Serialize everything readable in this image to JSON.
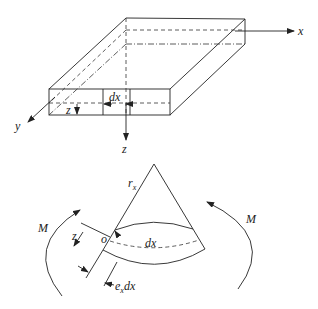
{
  "diagram": {
    "top_figure": {
      "description": "thin plate with coordinate axes and element dx",
      "axis_labels": {
        "x": "x",
        "y": "y",
        "z": "z"
      },
      "element_label": "dx",
      "offset_label": "z"
    },
    "bottom_figure": {
      "description": "bent plate element under moment M",
      "radius_label": "r",
      "radius_sub": "x",
      "moment_left": "M",
      "moment_right": "M",
      "element_label": "dx",
      "offset_label": "z",
      "origin_label": "o",
      "strain_label_prefix": "e",
      "strain_label_sub": "x",
      "strain_label_suffix": "dx"
    }
  }
}
